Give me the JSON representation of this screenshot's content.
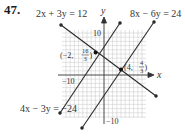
{
  "problem_number": "47.",
  "graph": {
    "axes": {
      "x_label": "x",
      "y_label": "y",
      "x_tick_label": "−10",
      "y_tick_top_label": "10",
      "y_tick_bottom_label": "−10",
      "range": [
        -10,
        10
      ]
    },
    "lines": [
      {
        "equation": "2x + 3y = 12",
        "color": "#2a2a2a"
      },
      {
        "equation": "8x − 6y = 24",
        "color": "#2a2a2a"
      },
      {
        "equation": "4x − 3y = −24",
        "color": "#2a2a2a"
      }
    ],
    "points": [
      {
        "label_prefix": "(−2, ",
        "num": "16",
        "den": "3",
        "suffix": ")",
        "x": -2,
        "y": 5.3333
      },
      {
        "label_prefix": "(4, ",
        "num": "4",
        "den": "3",
        "suffix": ")",
        "x": 4,
        "y": 1.3333
      }
    ],
    "grid_color": "#c8c8c8",
    "axis_color": "#333333"
  }
}
